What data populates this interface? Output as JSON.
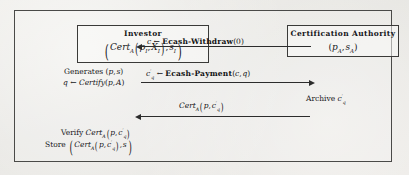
{
  "figure": {
    "type": "protocol-sequence-diagram",
    "participants": [
      {
        "id": "investor",
        "title": "Investor",
        "state_expression": "( Cert_A ( p_I , X_I ) , s_I )",
        "state_parts": {
          "cert": "Cert",
          "cert_sub": "A",
          "arg1": "p",
          "arg1_sub": "I",
          "arg2": "X",
          "arg2_sub": "I",
          "arg3": "s",
          "arg3_sub": "I"
        }
      },
      {
        "id": "certification-authority",
        "title": "Certification Authority",
        "state_expression": "( p_A , s_A )",
        "state_parts": {
          "arg1": "p",
          "arg1_sub": "A",
          "arg2": "s",
          "arg2_sub": "A"
        }
      }
    ],
    "notes": [
      {
        "id": "investor-generates",
        "owner": "investor",
        "lines": [
          "Generates (p, s)",
          "q ← Certify(p, A)"
        ],
        "line1_parts": {
          "label": "Generates",
          "arg1": "p",
          "arg2": "s"
        },
        "line2_parts": {
          "lhs": "q",
          "arrow": "←",
          "fn": "Certify",
          "arg1": "p",
          "arg2": "A"
        }
      },
      {
        "id": "ca-archive",
        "owner": "certification-authority",
        "lines": [
          "Archive c'_q"
        ],
        "parts": {
          "label": "Archive",
          "var": "c",
          "prime": "′",
          "sub": "q"
        }
      },
      {
        "id": "investor-verify-store",
        "owner": "investor",
        "lines": [
          "Verify Cert_A ( p , c'_q )",
          "Store ( Cert_A ( p , c'_q ) , s )"
        ],
        "verify_parts": {
          "label": "Verify",
          "cert": "Cert",
          "cert_sub": "A",
          "arg1": "p",
          "arg2": "c",
          "arg2_prime": "′",
          "arg2_sub": "q"
        },
        "store_parts": {
          "label": "Store",
          "cert": "Cert",
          "cert_sub": "A",
          "arg1": "p",
          "arg2": "c",
          "arg2_prime": "′",
          "arg2_sub": "q",
          "arg3": "s"
        }
      }
    ],
    "messages": [
      {
        "index": 1,
        "direction": "right-to-left",
        "from": "certification-authority",
        "to": "investor",
        "label": "c ← Ecash-Withdraw(0)",
        "parts": {
          "lhs": "c",
          "arrow": "←",
          "fn": "Ecash-Withdraw",
          "open": "(",
          "arg": "0",
          "close": ")"
        }
      },
      {
        "index": 2,
        "direction": "left-to-right",
        "from": "investor",
        "to": "certification-authority",
        "label": "c'_q ← Ecash-Payment(c, q)",
        "parts": {
          "lhs": "c",
          "lhs_prime": "′",
          "lhs_sub": "q",
          "arrow": "←",
          "fn": "Ecash-Payment",
          "open": "(",
          "arg1": "c",
          "comma": ",",
          "arg2": "q",
          "close": ")"
        }
      },
      {
        "index": 3,
        "direction": "right-to-left",
        "from": "certification-authority",
        "to": "investor",
        "label": "Cert_A ( p , c'_q )",
        "parts": {
          "cert": "Cert",
          "cert_sub": "A",
          "arg1": "p",
          "comma": ",",
          "arg2": "c",
          "arg2_prime": "′",
          "arg2_sub": "q"
        }
      }
    ],
    "colors": {
      "ink": "#16161a",
      "rule": "#3a3a38",
      "background": "#e9e8e4"
    }
  }
}
